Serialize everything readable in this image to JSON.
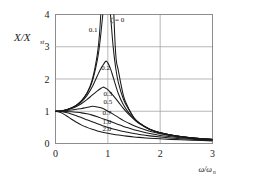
{
  "figure": {
    "background_color": "#ffffff",
    "frame_color": "#8d8d8d",
    "grid_color": "#9a9a9a",
    "curve_color": "#1a1a1a"
  },
  "axes": {
    "ylabel": "X/X",
    "ylabel_sub": "st",
    "xlabel": "ω/ω",
    "xlabel_sub": "n",
    "x_ticks": [
      "0",
      "1",
      "2",
      "3"
    ],
    "y_ticks": [
      "0",
      "1",
      "2",
      "3",
      "4"
    ]
  },
  "annotations": {
    "zeta_eq_zero": "ζ = 0",
    "c01": "0.1",
    "c02": "0.2",
    "c03": "0.3",
    "c05": "0.5",
    "c07": "0.7",
    "c10": "1.0",
    "c20": "2.0"
  },
  "chart_data": {
    "type": "line",
    "title": "",
    "xlabel": "ω/ωn",
    "ylabel": "X/Xst",
    "xlim": [
      0,
      3
    ],
    "ylim": [
      0,
      4
    ],
    "x_ticks": [
      0,
      1,
      2,
      3
    ],
    "y_ticks": [
      0,
      1,
      2,
      3,
      4
    ],
    "grid": true,
    "legend_position": "inline-curve-labels",
    "formula": "X/Xst = 1 / sqrt((1-r^2)^2 + (2*zeta*r)^2)",
    "series": [
      {
        "name": "ζ = 0",
        "zeta": 0.0,
        "label": "ζ = 0",
        "label_at": {
          "x": 1.18,
          "y": 3.78
        },
        "peak": {
          "x": 1.0,
          "y": null
        },
        "x": [
          0,
          0.1,
          0.2,
          0.3,
          0.4,
          0.5,
          0.6,
          0.7,
          0.8,
          0.85,
          0.9,
          0.93,
          0.95,
          0.97,
          1.03,
          1.05,
          1.07,
          1.1,
          1.15,
          1.2,
          1.3,
          1.4,
          1.5,
          1.6,
          1.8,
          2.0,
          2.2,
          2.5,
          2.8,
          3.0
        ],
        "y": [
          1.0,
          1.01,
          1.042,
          1.099,
          1.19,
          1.333,
          1.563,
          1.961,
          2.778,
          3.604,
          5.263,
          7.67,
          10.26,
          16.92,
          16.06,
          9.76,
          7.22,
          4.76,
          2.79,
          2.27,
          1.47,
          1.08,
          0.8,
          0.641,
          0.446,
          0.333,
          0.263,
          0.19,
          0.146,
          0.125
        ]
      },
      {
        "name": "ζ = 0.1",
        "zeta": 0.1,
        "label": "0.1",
        "label_at": {
          "x": 0.72,
          "y": 3.45
        },
        "peak": {
          "x": 0.99,
          "y": 5.03
        },
        "x": [
          0,
          0.1,
          0.2,
          0.3,
          0.4,
          0.5,
          0.6,
          0.7,
          0.8,
          0.85,
          0.9,
          0.95,
          0.99,
          1.05,
          1.1,
          1.15,
          1.2,
          1.3,
          1.4,
          1.5,
          1.6,
          1.8,
          2.0,
          2.2,
          2.5,
          2.8,
          3.0
        ],
        "y": [
          1.0,
          1.01,
          1.041,
          1.098,
          1.188,
          1.328,
          1.548,
          1.913,
          2.596,
          3.154,
          3.936,
          4.716,
          5.025,
          4.002,
          3.028,
          2.345,
          1.899,
          1.364,
          1.051,
          0.792,
          0.638,
          0.445,
          0.333,
          0.263,
          0.19,
          0.146,
          0.125
        ]
      },
      {
        "name": "ζ = 0.2",
        "zeta": 0.2,
        "label": "0.2",
        "label_at": {
          "x": 0.96,
          "y": 2.28
        },
        "peak": {
          "x": 0.96,
          "y": 2.55
        },
        "x": [
          0,
          0.1,
          0.2,
          0.3,
          0.4,
          0.5,
          0.6,
          0.7,
          0.8,
          0.85,
          0.9,
          0.96,
          1.0,
          1.05,
          1.1,
          1.2,
          1.3,
          1.4,
          1.5,
          1.6,
          1.8,
          2.0,
          2.2,
          2.5,
          2.8,
          3.0
        ],
        "y": [
          1.0,
          1.01,
          1.04,
          1.093,
          1.177,
          1.302,
          1.486,
          1.75,
          2.1,
          2.27,
          2.41,
          2.552,
          2.5,
          2.32,
          2.07,
          1.55,
          1.19,
          0.95,
          0.77,
          0.63,
          0.44,
          0.33,
          0.262,
          0.19,
          0.146,
          0.125
        ]
      },
      {
        "name": "ζ = 0.3",
        "zeta": 0.3,
        "label": "0.3",
        "label_at": {
          "x": 1.0,
          "y": 1.47
        },
        "peak": {
          "x": 0.91,
          "y": 1.75
        },
        "x": [
          0,
          0.1,
          0.2,
          0.3,
          0.4,
          0.5,
          0.6,
          0.7,
          0.8,
          0.85,
          0.91,
          0.95,
          1.0,
          1.1,
          1.2,
          1.3,
          1.4,
          1.5,
          1.6,
          1.8,
          2.0,
          2.2,
          2.5,
          2.8,
          3.0
        ],
        "y": [
          1.0,
          1.009,
          1.036,
          1.082,
          1.15,
          1.241,
          1.36,
          1.497,
          1.63,
          1.69,
          1.747,
          1.72,
          1.667,
          1.49,
          1.29,
          1.08,
          0.9,
          0.75,
          0.62,
          0.435,
          0.33,
          0.26,
          0.19,
          0.146,
          0.125
        ]
      },
      {
        "name": "ζ = 0.5",
        "zeta": 0.5,
        "label": "0.5",
        "label_at": {
          "x": 1.0,
          "y": 1.22
        },
        "peak": {
          "x": 0.71,
          "y": 1.155
        },
        "x": [
          0,
          0.1,
          0.2,
          0.3,
          0.4,
          0.5,
          0.6,
          0.71,
          0.8,
          0.9,
          1.0,
          1.1,
          1.2,
          1.3,
          1.4,
          1.5,
          1.6,
          1.8,
          2.0,
          2.2,
          2.5,
          2.8,
          3.0
        ],
        "y": [
          1.0,
          1.005,
          1.018,
          1.036,
          1.06,
          1.088,
          1.115,
          1.155,
          1.13,
          1.09,
          1.0,
          0.91,
          0.81,
          0.71,
          0.63,
          0.55,
          0.485,
          0.38,
          0.3,
          0.243,
          0.182,
          0.142,
          0.122
        ]
      },
      {
        "name": "ζ = 0.7",
        "zeta": 0.7,
        "label": "0.7",
        "label_at": {
          "x": 0.98,
          "y": 0.87
        },
        "peak": {
          "x": 0.2,
          "y": 1.0
        },
        "x": [
          0,
          0.1,
          0.2,
          0.3,
          0.4,
          0.5,
          0.6,
          0.7,
          0.8,
          0.9,
          1.0,
          1.1,
          1.2,
          1.3,
          1.4,
          1.5,
          1.6,
          1.8,
          2.0,
          2.2,
          2.5,
          2.8,
          3.0
        ],
        "y": [
          1.0,
          0.998,
          0.994,
          0.985,
          0.97,
          0.95,
          0.92,
          0.88,
          0.83,
          0.77,
          0.714,
          0.65,
          0.59,
          0.53,
          0.48,
          0.43,
          0.385,
          0.31,
          0.25,
          0.21,
          0.16,
          0.127,
          0.11
        ]
      },
      {
        "name": "ζ = 1.0",
        "zeta": 1.0,
        "label": "1.0",
        "label_at": {
          "x": 0.98,
          "y": 0.62
        },
        "peak": null,
        "x": [
          0,
          0.1,
          0.2,
          0.3,
          0.4,
          0.5,
          0.6,
          0.7,
          0.8,
          0.9,
          1.0,
          1.1,
          1.2,
          1.3,
          1.4,
          1.5,
          1.6,
          1.8,
          2.0,
          2.2,
          2.5,
          2.8,
          3.0
        ],
        "y": [
          1.0,
          0.99,
          0.962,
          0.917,
          0.862,
          0.8,
          0.735,
          0.671,
          0.61,
          0.553,
          0.5,
          0.452,
          0.41,
          0.372,
          0.338,
          0.308,
          0.281,
          0.236,
          0.2,
          0.171,
          0.138,
          0.113,
          0.1
        ]
      },
      {
        "name": "ζ = 2.0",
        "zeta": 2.0,
        "label": "2.0",
        "label_at": {
          "x": 0.98,
          "y": 0.38
        },
        "peak": null,
        "x": [
          0,
          0.1,
          0.2,
          0.3,
          0.4,
          0.5,
          0.6,
          0.7,
          0.8,
          0.9,
          1.0,
          1.1,
          1.2,
          1.3,
          1.4,
          1.5,
          1.6,
          1.8,
          2.0,
          2.2,
          2.5,
          2.8,
          3.0
        ],
        "y": [
          1.0,
          0.962,
          0.87,
          0.76,
          0.66,
          0.57,
          0.5,
          0.44,
          0.39,
          0.35,
          0.316,
          0.287,
          0.262,
          0.24,
          0.221,
          0.204,
          0.19,
          0.165,
          0.145,
          0.128,
          0.108,
          0.091,
          0.082
        ]
      }
    ]
  }
}
